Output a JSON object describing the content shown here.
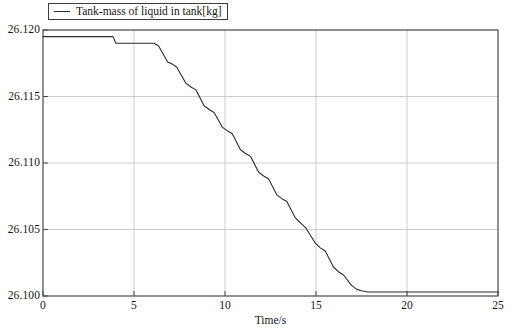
{
  "chart_data": {
    "type": "line",
    "title": "",
    "subtitle": "",
    "xlabel": "Time/s",
    "ylabel": "",
    "xlim": [
      0,
      25
    ],
    "ylim": [
      26.1,
      26.12
    ],
    "grid": true,
    "legend_position": "top-left",
    "xticks": [
      "0",
      "5",
      "10",
      "15",
      "20",
      "25"
    ],
    "xtick_values": [
      0,
      5,
      10,
      15,
      20,
      25
    ],
    "yticks": [
      "26.100",
      "26.105",
      "26.110",
      "26.115",
      "26.120"
    ],
    "ytick_values": [
      26.1,
      26.105,
      26.11,
      26.115,
      26.12
    ],
    "series": [
      {
        "name": "Tank-mass of liquid in tank[kg]",
        "color": "#2b2b2b",
        "x": [
          0.0,
          3.85,
          4.0,
          4.15,
          6.1,
          6.35,
          6.85,
          7.15,
          7.35,
          7.85,
          8.15,
          8.4,
          8.85,
          9.15,
          9.4,
          9.85,
          10.15,
          10.4,
          10.85,
          11.15,
          11.4,
          11.85,
          12.15,
          12.4,
          12.85,
          13.15,
          13.4,
          13.85,
          14.15,
          14.45,
          14.95,
          15.25,
          15.5,
          15.95,
          16.25,
          16.5,
          16.95,
          17.25,
          17.5,
          17.85,
          18.0,
          25.0
        ],
        "y": [
          26.1195,
          26.1195,
          26.119,
          26.119,
          26.119,
          26.1188,
          26.1176,
          26.1174,
          26.1172,
          26.116,
          26.1157,
          26.1155,
          26.1143,
          26.114,
          26.1138,
          26.1127,
          26.1124,
          26.1122,
          26.111,
          26.1107,
          26.1105,
          26.1093,
          26.109,
          26.1088,
          26.1076,
          26.1073,
          26.1071,
          26.1059,
          26.1055,
          26.1051,
          26.104,
          26.1036,
          26.1034,
          26.1022,
          26.1018,
          26.1016,
          26.1008,
          26.1005,
          26.1004,
          26.1003,
          26.1003,
          26.1003
        ]
      }
    ],
    "annotations": []
  },
  "legend": {
    "entries": [
      {
        "label": "Tank-mass of liquid in tank[kg]",
        "swatch": "line-swatch-icon"
      }
    ]
  },
  "axes": {
    "x_title": "Time/s"
  }
}
